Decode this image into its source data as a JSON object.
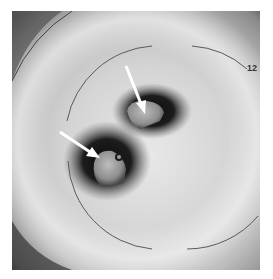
{
  "image": {
    "description": "Grayscale endoscopic/ultrasound-style radial image with two white arrows pointing at dark lesions",
    "annotations": {
      "depth_label": "12",
      "arrows": [
        {
          "name": "upper-arrow",
          "from": [
            125,
            66
          ],
          "to": [
            142,
            104
          ]
        },
        {
          "name": "lower-arrow",
          "from": [
            60,
            132
          ],
          "to": [
            92,
            154
          ]
        }
      ]
    },
    "colors": {
      "background": "#ffffff",
      "arc": "#555555",
      "arrow": "#ffffff",
      "dark": "#111111"
    }
  }
}
